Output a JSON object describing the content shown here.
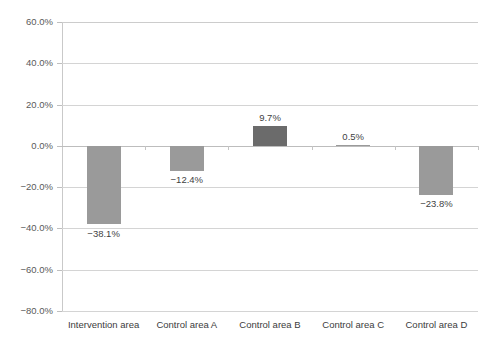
{
  "chart_data": {
    "type": "bar",
    "title": "",
    "subtitle": "",
    "xlabel": "",
    "ylabel": "",
    "categories": [
      "Intervention area",
      "Control area A",
      "Control area B",
      "Control area C",
      "Control area D"
    ],
    "values": [
      -38.1,
      -12.4,
      9.7,
      0.5,
      -23.8
    ],
    "data_labels": [
      "−38.1%",
      "−12.4%",
      "9.7%",
      "0.5%",
      "−23.8%"
    ],
    "bar_colors": [
      "#9a9a9a",
      "#9a9a9a",
      "#6b6b6b",
      "#9a9a9a",
      "#9a9a9a"
    ],
    "ylim": [
      -80,
      60
    ],
    "ytick_values": [
      60,
      40,
      20,
      0,
      -20,
      -40,
      -60,
      -80
    ],
    "ytick_labels": [
      "60.0%",
      "40.0%",
      "20.0%",
      "0.0%",
      "−20.0%",
      "−40.0%",
      "−60.0%",
      "−80.0%"
    ],
    "grid": true,
    "grid_axis": "y",
    "legend": false,
    "legend_position": "none",
    "background_color": "#ffffff",
    "gridline_color": "#d4d4d4",
    "axis_color": "#c9c9c9",
    "text_color": "#3c3c3c"
  }
}
